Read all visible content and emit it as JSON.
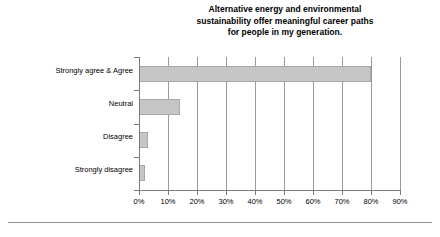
{
  "chart_data": {
    "type": "bar",
    "orientation": "horizontal",
    "title": "Alternative energy and environmental sustainability offer meaningful career paths for people in my generation.",
    "title_lines": [
      "Alternative energy and environmental",
      "sustainability offer meaningful career paths",
      "for people in my generation."
    ],
    "categories": [
      "Strongly agree & Agree",
      "Neutral",
      "Disagree",
      "Strongly disagree"
    ],
    "values": [
      80,
      14,
      3,
      2
    ],
    "xlabel": "",
    "ylabel": "",
    "xlim": [
      0,
      90
    ],
    "x_ticks": [
      0,
      10,
      20,
      30,
      40,
      50,
      60,
      70,
      80,
      90
    ],
    "x_tick_labels": [
      "0%",
      "10%",
      "20%",
      "30%",
      "40%",
      "50%",
      "60%",
      "70%",
      "80%",
      "90%"
    ],
    "grid": "vertical",
    "legend": "none",
    "bar_color": "#c6c6c6",
    "bar_edge_color": "#a8a8a8",
    "axis_color": "#7a7a7a",
    "gridline_color": "#9a9a9a",
    "text_color": "#000000",
    "background_color": "#ffffff"
  }
}
